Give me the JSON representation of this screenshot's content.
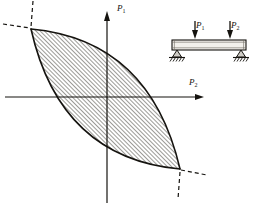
{
  "figure": {
    "type": "engineering-diagram",
    "background_color": "#ffffff",
    "ink_color": "#15130f",
    "hatch_color": "#3a3730",
    "fill_color": "#ffffff"
  },
  "plot": {
    "origin": {
      "x": 107,
      "y": 97
    },
    "axes": {
      "vertical": {
        "name": "P1-axis",
        "label": "P",
        "subscript": "1",
        "x": 107,
        "top_y": 12,
        "bottom_y": 203,
        "arrow": "up"
      },
      "horizontal": {
        "name": "P2-axis",
        "label": "P",
        "subscript": "2",
        "y": 97,
        "left_x": 5,
        "right_x": 204,
        "arrow": "right"
      }
    },
    "locus": {
      "name": "interaction-locus",
      "shape": "lens",
      "hatched": true,
      "hatch_angle_deg": 45,
      "hatch_spacing_px": 3,
      "tip_upper_left": {
        "x": 31,
        "y": 29
      },
      "tip_lower_right": {
        "x": 180,
        "y": 169
      },
      "upper_curve_control": {
        "x": 150,
        "y": 40
      },
      "lower_curve_control": {
        "x": 60,
        "y": 158
      }
    },
    "asymptote_dashes": [
      {
        "name": "dash-upper-left-horizontal",
        "x1": 3,
        "y1": 24,
        "x2": 33,
        "y2": 29
      },
      {
        "name": "dash-upper-left-vertical",
        "x1": 33,
        "y1": 1,
        "x2": 31,
        "y2": 27
      },
      {
        "name": "dash-lower-right-horizontal",
        "x1": 178,
        "y1": 170,
        "x2": 206,
        "y2": 175
      },
      {
        "name": "dash-lower-right-vertical",
        "x1": 180,
        "y1": 171,
        "x2": 178,
        "y2": 199
      }
    ]
  },
  "inset_beam": {
    "name": "simply-supported-beam",
    "beam": {
      "x": 172,
      "y": 40,
      "width": 74,
      "height": 10
    },
    "loads": [
      {
        "name": "load-P1",
        "label": "P",
        "subscript": "1",
        "x": 195,
        "arrow_top_y": 21,
        "arrow_bottom_y": 39
      },
      {
        "name": "load-P2",
        "label": "P",
        "subscript": "2",
        "x": 230,
        "arrow_top_y": 21,
        "arrow_bottom_y": 39
      }
    ],
    "supports": [
      {
        "name": "support-left-pin",
        "x": 177,
        "y": 50,
        "type": "pin"
      },
      {
        "name": "support-right-roller",
        "x": 241,
        "y": 50,
        "type": "pin"
      }
    ]
  }
}
